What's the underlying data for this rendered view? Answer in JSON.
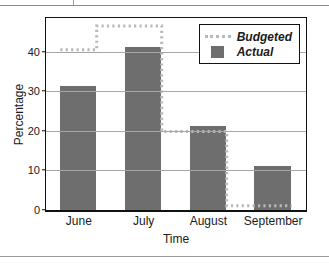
{
  "figure": {
    "y_axis_title": "Percentage",
    "x_axis_title": "Time"
  },
  "legend": {
    "items": [
      {
        "label": "Budgeted",
        "marker": "dotted-line-swatch",
        "color": "#b9b9b9"
      },
      {
        "label": "Actual",
        "marker": "filled-square-swatch",
        "color": "#6e6e6e"
      }
    ]
  },
  "colors": {
    "actual_bar": "#6e6e6e",
    "budgeted_line": "#b9b9b9",
    "gridline": "#a7a7a7",
    "axis": "#111111",
    "background": "#ffffff"
  },
  "chart_data": {
    "type": "bar",
    "title": "",
    "subtitle": "",
    "xlabel": "Time",
    "ylabel": "Percentage",
    "categories": [
      "June",
      "July",
      "August",
      "September"
    ],
    "series": [
      {
        "name": "Actual",
        "style": "bar",
        "color": "#6e6e6e",
        "values": [
          31.7,
          41.5,
          21.5,
          11.3
        ]
      },
      {
        "name": "Budgeted",
        "style": "dotted-step-line",
        "color": "#b9b9b9",
        "values": [
          40.5,
          46.5,
          20.0,
          1.3
        ]
      }
    ],
    "ylim": [
      0,
      48.5
    ],
    "yticks": [
      0,
      10,
      20,
      30,
      40
    ],
    "ytick_labels": [
      "0",
      "10",
      "20",
      "30",
      "40"
    ],
    "grid": true,
    "grid_axis": "y",
    "legend_position": "upper right"
  }
}
